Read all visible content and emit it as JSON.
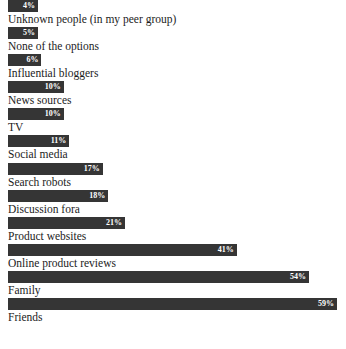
{
  "chart_data": {
    "type": "bar",
    "orientation": "horizontal",
    "title": "",
    "xlabel": "",
    "ylabel": "",
    "grid": false,
    "legend": null,
    "xlim": [
      0,
      59
    ],
    "value_suffix": "%",
    "bar_color": "#353535",
    "value_label_color": "#ffffff",
    "category_label_color": "#1c1c1c",
    "background": "#ffffff",
    "categories": [
      "Unknown people (in my peer group)",
      "None of the options",
      "Influential bloggers",
      "News sources",
      "TV",
      "Social media",
      "Search robots",
      "Discussion fora",
      "Product websites",
      "Online product reviews",
      "Family",
      "Friends"
    ],
    "values": [
      4,
      5,
      6,
      10,
      10,
      11,
      17,
      18,
      21,
      41,
      54,
      59
    ],
    "value_labels": [
      "4%",
      "5%",
      "6%",
      "10%",
      "10%",
      "11%",
      "17%",
      "18%",
      "21%",
      "41%",
      "54%",
      "59%"
    ]
  },
  "rows": [
    {
      "label": "Unknown people (in my peer group)",
      "value": 4,
      "value_label": "4%"
    },
    {
      "label": "None of the options",
      "value": 5,
      "value_label": "5%"
    },
    {
      "label": "Influential bloggers",
      "value": 6,
      "value_label": "6%"
    },
    {
      "label": "News sources",
      "value": 10,
      "value_label": "10%"
    },
    {
      "label": "TV",
      "value": 10,
      "value_label": "10%"
    },
    {
      "label": "Social media",
      "value": 11,
      "value_label": "11%"
    },
    {
      "label": "Search robots",
      "value": 17,
      "value_label": "17%"
    },
    {
      "label": "Discussion fora",
      "value": 18,
      "value_label": "18%"
    },
    {
      "label": "Product websites",
      "value": 21,
      "value_label": "21%"
    },
    {
      "label": "Online product reviews",
      "value": 41,
      "value_label": "41%"
    },
    {
      "label": "Family",
      "value": 54,
      "value_label": "54%"
    },
    {
      "label": "Friends",
      "value": 59,
      "value_label": "59%"
    }
  ]
}
